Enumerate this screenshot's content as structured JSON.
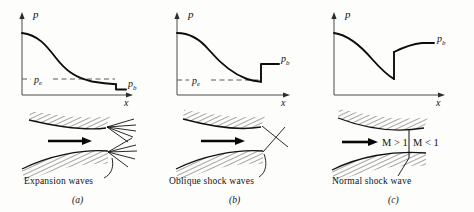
{
  "figure": {
    "background_color": "#fdfdfc",
    "ink_color": "#111111"
  },
  "axis_labels": {
    "pressure": "p",
    "distance": "x"
  },
  "pressure_labels": {
    "back_pressure": "p_b",
    "exit_pressure": "p_e"
  },
  "panels": [
    {
      "id": "a",
      "letter": "(a)",
      "caption": "Expansion waves",
      "wave_type": "expansion-fan",
      "y_axis_label": "p",
      "x_axis_label": "x",
      "shows_pe_line": true,
      "pe_label": "p",
      "pe_sub": "e",
      "pb_label": "p",
      "pb_sub": "b",
      "mach_labels": [],
      "description": "Underexpanded jet: pressure falls smoothly to below back pressure, expansion fans emanate from both nozzle lips"
    },
    {
      "id": "b",
      "letter": "(b)",
      "caption": "Oblique shock waves",
      "wave_type": "oblique-shock",
      "y_axis_label": "p",
      "x_axis_label": "x",
      "shows_pe_line": true,
      "pe_label": "p",
      "pe_sub": "e",
      "pb_label": "p",
      "pb_sub": "b",
      "mach_labels": [],
      "description": "Overexpanded jet: pressure rises in a step at the exit to the back pressure, oblique shocks from each lip"
    },
    {
      "id": "c",
      "letter": "(c)",
      "caption": "Normal shock wave",
      "wave_type": "normal-shock",
      "y_axis_label": "p",
      "x_axis_label": "x",
      "shows_pe_line": false,
      "pe_label": "",
      "pe_sub": "",
      "pb_label": "p",
      "pb_sub": "b",
      "mach_labels": [
        "M > 1",
        "M < 1"
      ],
      "description": "Normal shock inside the divergent section: abrupt pressure jump then subsonic compression to back pressure"
    }
  ],
  "mach": {
    "supersonic": "M > 1",
    "subsonic": "M < 1"
  }
}
